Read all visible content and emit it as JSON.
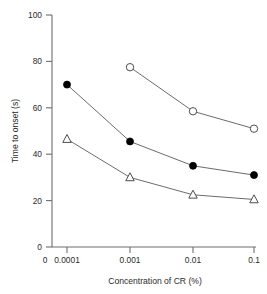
{
  "chart_data": {
    "type": "line",
    "title": "",
    "subtitle": "",
    "xlabel": "Concentration of CR (%)",
    "ylabel": "Time to onset (s)",
    "x_categories": [
      "0",
      "0.0001",
      "0.001",
      "0.01",
      "0.1"
    ],
    "x_tick_labels": [
      "0",
      "0.0001",
      "0.001",
      "0.01",
      "0.1"
    ],
    "y_tick_labels": [
      "0",
      "20",
      "40",
      "60",
      "80",
      "100"
    ],
    "y_ticks": [
      0,
      20,
      40,
      60,
      80,
      100
    ],
    "ylim": [
      0,
      100
    ],
    "grid": false,
    "legend": "none",
    "legend_position": "none",
    "series": [
      {
        "name": "open-circle-series",
        "marker": "open-circle",
        "x": [
          "0.001",
          "0.01",
          "0.1"
        ],
        "values": [
          77.5,
          58.5,
          51.0
        ]
      },
      {
        "name": "filled-circle-series",
        "marker": "filled-circle",
        "x": [
          "0.0001",
          "0.001",
          "0.01",
          "0.1"
        ],
        "values": [
          70.0,
          45.5,
          35.0,
          31.0
        ]
      },
      {
        "name": "open-triangle-series",
        "marker": "open-triangle",
        "x": [
          "0.0001",
          "0.001",
          "0.01",
          "0.1"
        ],
        "values": [
          46.5,
          30.0,
          22.5,
          20.5
        ]
      }
    ]
  },
  "axes": {
    "y_label_text": "Time to onset (s)",
    "x_label_text": "Concentration of CR (%)",
    "y0": "0",
    "y20": "20",
    "y40": "40",
    "y60": "60",
    "y80": "80",
    "y100": "100",
    "x0": "0",
    "x1": "0.0001",
    "x2": "0.001",
    "x3": "0.01",
    "x4": "0.1"
  },
  "colors": {
    "axis": "#6e6e6e",
    "text": "#2b2b2b",
    "line": "#5a5a5a",
    "filled_marker": "#000000",
    "open_marker_fill": "#ffffff",
    "open_marker_stroke": "#3a3a3a",
    "background": "#ffffff"
  }
}
